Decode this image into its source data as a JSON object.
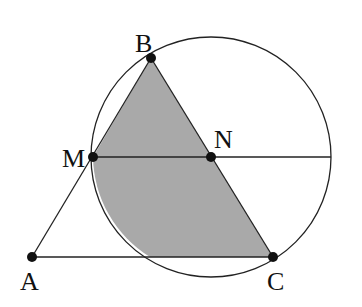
{
  "diagram": {
    "type": "geometry",
    "points": {
      "A": {
        "label": "A",
        "x": 32,
        "y": 257
      },
      "B": {
        "label": "B",
        "x": 151,
        "y": 58
      },
      "C": {
        "label": "C",
        "x": 273,
        "y": 257
      },
      "M": {
        "label": "M",
        "x": 93,
        "y": 157
      },
      "N": {
        "label": "N",
        "x": 211,
        "y": 157
      }
    },
    "circle": {
      "center": "N",
      "cx": 211,
      "cy": 157,
      "r": 120
    },
    "segments": [
      "AB",
      "AC",
      "BC",
      "MN",
      "N-radius-right"
    ],
    "shaded_region": "B-M-arc-AC-C",
    "colors": {
      "stroke": "#222222",
      "fill": "#a9a9a9",
      "point": "#111111"
    }
  },
  "labels": {
    "A": "A",
    "B": "B",
    "C": "C",
    "M": "M",
    "N": "N"
  }
}
